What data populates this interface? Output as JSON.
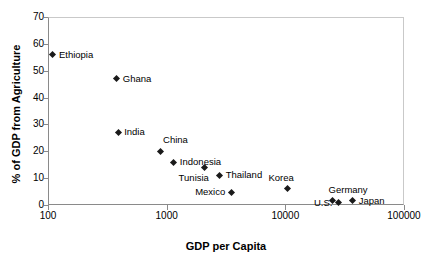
{
  "chart_data": {
    "type": "scatter",
    "title": "",
    "xlabel": "GDP per Capita",
    "ylabel": "% of GDP from Agriculture",
    "xscale": "log",
    "yscale": "linear",
    "xlim": [
      100,
      100000
    ],
    "ylim": [
      0,
      70
    ],
    "xticks": [
      "100",
      "1000",
      "10000",
      "100000"
    ],
    "xtick_values": [
      100,
      1000,
      10000,
      100000
    ],
    "yticks": [
      "0",
      "10",
      "20",
      "30",
      "40",
      "50",
      "60",
      "70"
    ],
    "ytick_values": [
      0,
      10,
      20,
      30,
      40,
      50,
      60,
      70
    ],
    "grid": false,
    "legend": "none",
    "marker": "filled-diamond",
    "marker_color": "#1a1a1a",
    "points": [
      {
        "label": "Ethiopia",
        "x": 110,
        "y": 56,
        "label_side": "right"
      },
      {
        "label": "Ghana",
        "x": 380,
        "y": 47,
        "label_side": "right"
      },
      {
        "label": "India",
        "x": 390,
        "y": 27,
        "label_side": "right"
      },
      {
        "label": "China",
        "x": 880,
        "y": 20,
        "label_side": "above-right"
      },
      {
        "label": "Indonesia",
        "x": 1150,
        "y": 16,
        "label_side": "right"
      },
      {
        "label": "Tunisia",
        "x": 2100,
        "y": 14,
        "label_side": "below-left"
      },
      {
        "label": "Thailand",
        "x": 2800,
        "y": 11,
        "label_side": "right"
      },
      {
        "label": "Mexico",
        "x": 3500,
        "y": 4.8,
        "label_side": "left"
      },
      {
        "label": "Korea",
        "x": 10500,
        "y": 6,
        "label_side": "above-left"
      },
      {
        "label": "Germany",
        "x": 25000,
        "y": 1.6,
        "label_side": "above"
      },
      {
        "label": "U.S.",
        "x": 28000,
        "y": 0.8,
        "label_side": "left"
      },
      {
        "label": "Japan",
        "x": 37000,
        "y": 1.6,
        "label_side": "right"
      }
    ]
  }
}
